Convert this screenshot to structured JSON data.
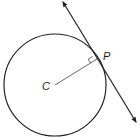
{
  "diagram": {
    "type": "circle-tangent",
    "labels": {
      "center": "C",
      "point": "P"
    },
    "colors": {
      "stroke": "#222222",
      "radius": "#666666",
      "background": "#ffffff"
    },
    "elements": [
      "circle centered at C",
      "radius CP",
      "tangent line through P with arrowheads at both ends",
      "right-angle marker at P"
    ]
  }
}
